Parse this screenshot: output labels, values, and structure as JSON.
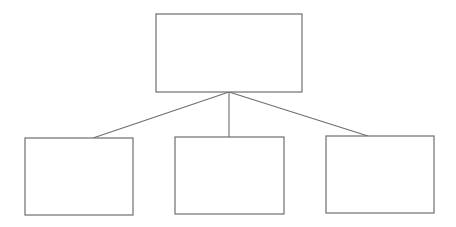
{
  "diagram": {
    "type": "hierarchy-tree",
    "stroke_color": "#6e6e6e",
    "fill_color": "#ffffff",
    "root": {
      "id": "root",
      "label": "",
      "x": 156,
      "y": 14,
      "width": 146,
      "height": 78
    },
    "children": [
      {
        "id": "child-left",
        "label": "",
        "x": 25,
        "y": 138,
        "width": 108,
        "height": 77
      },
      {
        "id": "child-middle",
        "label": "",
        "x": 175,
        "y": 137,
        "width": 109,
        "height": 77
      },
      {
        "id": "child-right",
        "label": "",
        "x": 326,
        "y": 136,
        "width": 108,
        "height": 77
      }
    ],
    "edges": [
      {
        "from": "root",
        "to": "child-left",
        "x1": 229,
        "y1": 92,
        "x2": 93,
        "y2": 138
      },
      {
        "from": "root",
        "to": "child-middle",
        "x1": 229,
        "y1": 92,
        "x2": 229,
        "y2": 137
      },
      {
        "from": "root",
        "to": "child-right",
        "x1": 229,
        "y1": 92,
        "x2": 368,
        "y2": 136
      }
    ]
  }
}
